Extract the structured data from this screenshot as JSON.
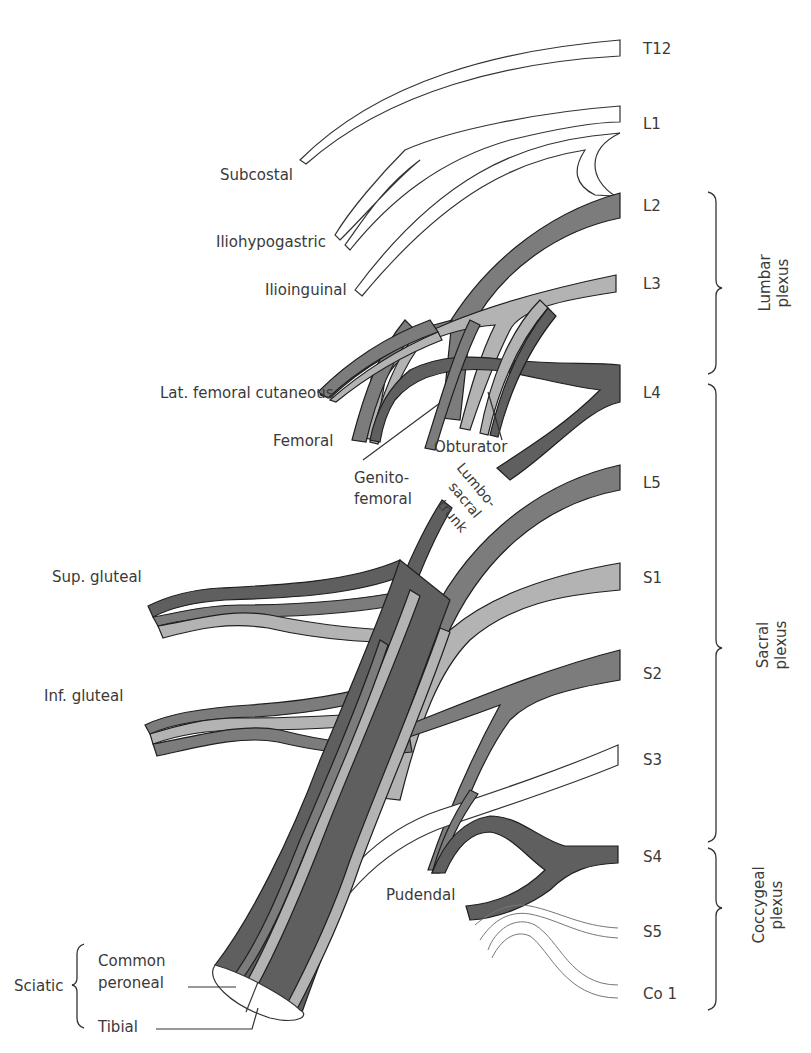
{
  "diagram": {
    "colors": {
      "dark_nerve": "#5f5f5f",
      "mid_nerve": "#7c7c7c",
      "light_nerve": "#b3b3b3",
      "white_nerve": "#ffffff",
      "outline": "#1f1f1f",
      "text": "#3a3a3a"
    },
    "roots": [
      {
        "id": "t12",
        "label": "T12"
      },
      {
        "id": "l1",
        "label": "L1"
      },
      {
        "id": "l2",
        "label": "L2"
      },
      {
        "id": "l3",
        "label": "L3"
      },
      {
        "id": "l4",
        "label": "L4"
      },
      {
        "id": "l5",
        "label": "L5"
      },
      {
        "id": "s1",
        "label": "S1"
      },
      {
        "id": "s2",
        "label": "S2"
      },
      {
        "id": "s3",
        "label": "S3"
      },
      {
        "id": "s4",
        "label": "S4"
      },
      {
        "id": "s5",
        "label": "S5"
      },
      {
        "id": "co1",
        "label": "Co 1"
      }
    ],
    "plexuses": [
      {
        "id": "lumbar",
        "line1": "Lumbar",
        "line2": "plexus"
      },
      {
        "id": "sacral",
        "line1": "Sacral",
        "line2": "plexus"
      },
      {
        "id": "coccygeal",
        "line1": "Coccygeal",
        "line2": "plexus"
      }
    ],
    "nerves": {
      "subcostal": "Subcostal",
      "iliohypogastric": "Iliohypogastric",
      "ilioinguinal": "Ilioinguinal",
      "lat_femoral_cutaneous": "Lat. femoral cutaneous",
      "femoral": "Femoral",
      "obturator": "Obturator",
      "genitofemoral_1": "Genito-",
      "genitofemoral_2": "femoral",
      "lumbosacral_1": "Lumbo-",
      "lumbosacral_2": "sacral",
      "lumbosacral_3": "trunk",
      "sup_gluteal": "Sup. gluteal",
      "inf_gluteal": "Inf. gluteal",
      "pudendal": "Pudendal",
      "sciatic": "Sciatic",
      "common_peroneal_1": "Common",
      "common_peroneal_2": "peroneal",
      "tibial": "Tibial"
    }
  }
}
